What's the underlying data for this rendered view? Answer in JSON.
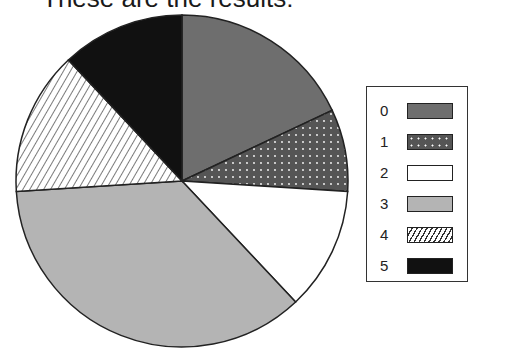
{
  "title": "These are the results:",
  "chart_data": {
    "type": "pie",
    "title": "These are the results:",
    "categories": [
      "0",
      "1",
      "2",
      "3",
      "4",
      "5"
    ],
    "values": [
      18,
      8,
      12,
      36,
      14,
      12
    ],
    "start_angle_deg": 0,
    "direction": "clockwise",
    "fills": [
      "#6e6e6e",
      "dots-dark",
      "#ffffff",
      "#b4b4b4",
      "diagonal-hatch",
      "#111111"
    ],
    "legend_position": "right"
  },
  "legend": {
    "items": [
      {
        "label": "0"
      },
      {
        "label": "1"
      },
      {
        "label": "2"
      },
      {
        "label": "3"
      },
      {
        "label": "4"
      },
      {
        "label": "5"
      }
    ]
  }
}
